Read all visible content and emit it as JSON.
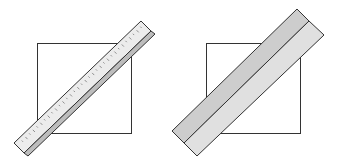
{
  "diagram": {
    "panels": [
      {
        "id": "left",
        "square": {
          "label": "",
          "fill": "#ffffff",
          "stroke": "#333333"
        },
        "tool": {
          "type": "ruler",
          "has_tick_marks": true,
          "face_color": "#ececec",
          "edge_color": "#bdbdbd",
          "stroke": "#333333"
        }
      },
      {
        "id": "right",
        "square": {
          "label": "",
          "fill": "#ffffff",
          "stroke": "#333333"
        },
        "tool": {
          "type": "wide-straightedge",
          "bands": 2,
          "band_colors": [
            "#cdcdcd",
            "#e0e0e0"
          ],
          "stroke": "#333333"
        }
      }
    ]
  }
}
